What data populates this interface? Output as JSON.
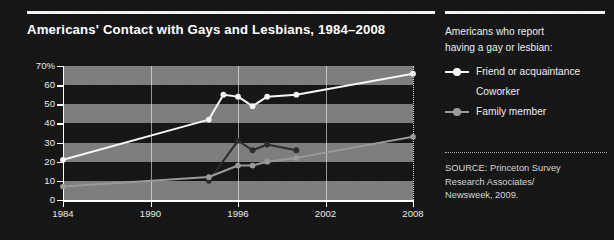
{
  "chart_data": {
    "type": "line",
    "title": "Americans' Contact with Gays and Lesbians, 1984–2008",
    "xlabel": "",
    "ylabel": "",
    "xlim": [
      1984,
      2008
    ],
    "ylim": [
      0,
      70
    ],
    "grid": "horizontal-bands-and-vertical-gridlines",
    "legend_position": "right",
    "y_ticks": [
      "70%",
      "60",
      "50",
      "40",
      "30",
      "20",
      "10",
      "0"
    ],
    "y_tick_values": [
      70,
      60,
      50,
      40,
      30,
      20,
      10,
      0
    ],
    "x_ticks": [
      "1984",
      "1990",
      "1996",
      "2002",
      "2008"
    ],
    "x_tick_values": [
      1984,
      1990,
      1996,
      2002,
      2008
    ],
    "series": [
      {
        "name": "Friend or acquaintance",
        "color": "#f5f5f5",
        "x": [
          1984,
          1994,
          1995,
          1996,
          1997,
          1998,
          2000,
          2008
        ],
        "values": [
          21,
          42,
          55,
          54,
          49,
          54,
          55,
          66
        ]
      },
      {
        "name": "Coworker",
        "color": "#2b2b2b",
        "x": [
          1994,
          1996,
          1997,
          1998,
          2000
        ],
        "values": [
          10,
          31,
          26,
          29,
          26
        ]
      },
      {
        "name": "Family member",
        "color": "#9a9a9a",
        "x": [
          1984,
          1994,
          1996,
          1997,
          1998,
          2000,
          2008
        ],
        "values": [
          7,
          12,
          18,
          18,
          20,
          22,
          33
        ]
      }
    ]
  },
  "header": {
    "title": "Americans' Contact with Gays and Lesbians, 1984–2008"
  },
  "legend": {
    "intro_line_1": "Americans who report",
    "intro_line_2": "having a gay or lesbian:",
    "items": [
      {
        "label": "Friend or acquaintance",
        "color": "#f5f5f5",
        "has_swatch": true
      },
      {
        "label": "Coworker",
        "color": "#2b2b2b",
        "has_swatch": false
      },
      {
        "label": "Family member",
        "color": "#9a9a9a",
        "has_swatch": true
      }
    ]
  },
  "source": {
    "line_1": "SOURCE: Princeton Survey",
    "line_2": "Research Associates/",
    "line_3": "Newsweek, 2009."
  },
  "colors": {
    "background": "#151515",
    "band": "#7d7d7d",
    "axis": "#ffffff",
    "text": "#ededed"
  }
}
